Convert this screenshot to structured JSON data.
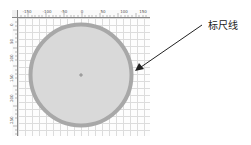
{
  "rulers": {
    "top_ticks": [
      "-150",
      "-100",
      "-50",
      "0",
      "50",
      "100",
      "150"
    ],
    "left_ticks": [
      "0",
      "50",
      "100",
      "150",
      "200",
      "250"
    ]
  },
  "shape": {
    "type": "circle",
    "fill_color": "#d8d8d8",
    "stroke_color": "#a6a6a6",
    "center_marker": "+"
  },
  "callout": {
    "label": "标尺线",
    "arrow_color": "#222222"
  }
}
